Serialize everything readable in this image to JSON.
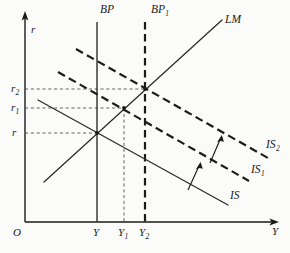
{
  "figure": {
    "kind": "economics-diagram",
    "name": "IS-LM-BP model with rightward IS shifts",
    "background_color": "#fbfbfa",
    "ink_color": "#1a1a1a"
  },
  "axes": {
    "y_axis_label": "r",
    "x_axis_label": "Y",
    "origin_label": "O",
    "y_axis_x": 25,
    "x_axis_y": 222,
    "y_axis_top": 14,
    "x_axis_right": 276
  },
  "y_ticks": [
    {
      "id": "r",
      "label": "r",
      "sub": "",
      "y": 133,
      "guide_to_x": 97
    },
    {
      "id": "r1",
      "label": "r",
      "sub": "1",
      "y": 108,
      "guide_to_x": 124
    },
    {
      "id": "r2",
      "label": "r",
      "sub": "2",
      "y": 89,
      "guide_to_x": 145
    }
  ],
  "x_ticks": [
    {
      "id": "Y",
      "label": "Y",
      "sub": "",
      "x": 97,
      "guide_to_y": 133
    },
    {
      "id": "Y1",
      "label": "Y",
      "sub": "1",
      "x": 124,
      "guide_to_y": 108
    },
    {
      "id": "Y2",
      "label": "Y",
      "sub": "2",
      "x": 145,
      "guide_to_y": 89
    }
  ],
  "curves": [
    {
      "id": "BP",
      "label": "B P",
      "label_text": "BP",
      "sub": "",
      "style": "solid-vertical",
      "x": 97,
      "y_top": 22,
      "y_bottom": 222,
      "label_x": 100,
      "label_y": 7
    },
    {
      "id": "BP1",
      "label_text": "BP",
      "sub": "1",
      "style": "dashed-vertical",
      "x": 145,
      "y_top": 22,
      "y_bottom": 222,
      "label_x": 152,
      "label_y": 7
    },
    {
      "id": "LM",
      "label_text": "LM",
      "sub": "",
      "style": "solid",
      "x1": 44,
      "y1": 182,
      "x2": 222,
      "y2": 20,
      "label_x": 226,
      "label_y": 18
    },
    {
      "id": "IS",
      "label_text": "IS",
      "sub": "",
      "style": "solid",
      "x1": 38,
      "y1": 100,
      "x2": 228,
      "y2": 205,
      "label_x": 230,
      "label_y": 193
    },
    {
      "id": "IS1",
      "label_text": "IS",
      "sub": "1",
      "style": "dashed",
      "x1": 58,
      "y1": 72,
      "x2": 249,
      "y2": 181,
      "label_x": 252,
      "label_y": 167
    },
    {
      "id": "IS2",
      "label_text": "IS",
      "sub": "2",
      "style": "dashed",
      "x1": 76,
      "y1": 49,
      "x2": 268,
      "y2": 158,
      "label_x": 268,
      "label_y": 142
    }
  ],
  "shift_arrows": [
    {
      "id": "shift-is-to-is1",
      "x1": 188,
      "y1": 190,
      "x2": 200,
      "y2": 163
    },
    {
      "id": "shift-is1-to-is2",
      "x1": 210,
      "y1": 163,
      "x2": 221,
      "y2": 136
    }
  ],
  "equilibria": [
    {
      "id": "eq-0",
      "x": 97,
      "y": 133
    },
    {
      "id": "eq-1",
      "x": 124,
      "y": 108
    },
    {
      "id": "eq-2",
      "x": 145,
      "y": 89
    }
  ]
}
